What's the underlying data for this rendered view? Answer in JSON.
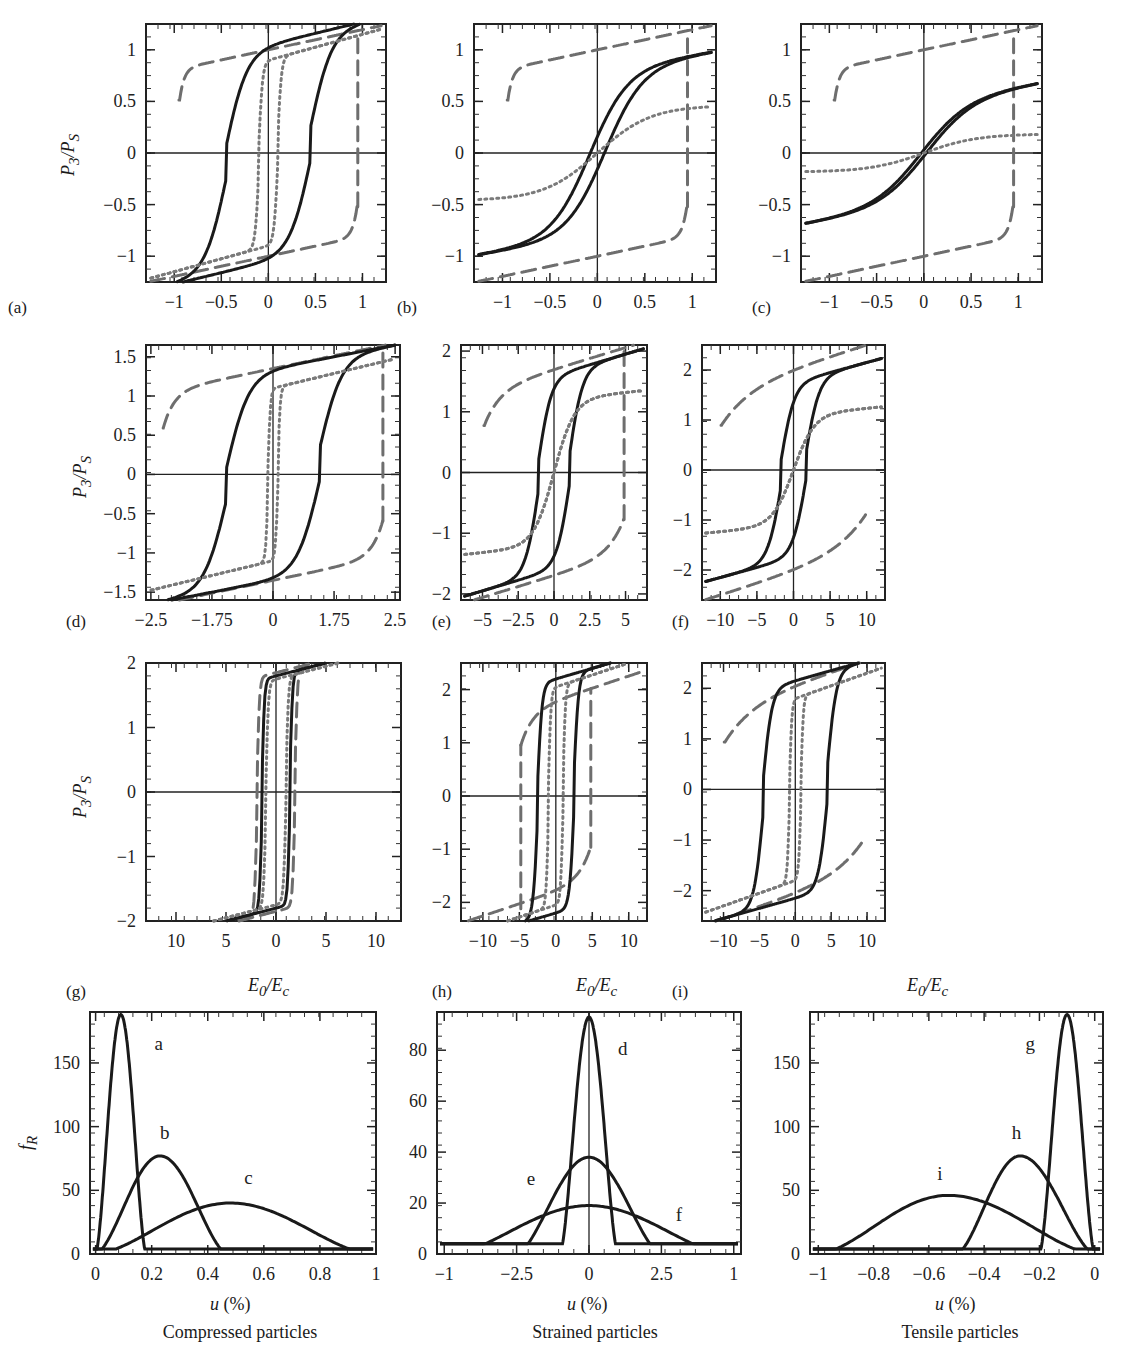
{
  "figure": {
    "y_axis_title_hysteresis": "P3/PS",
    "x_axis_title_hysteresis": "E0/Ec",
    "y_axis_title_distribution": "fR",
    "x_axis_title_distribution": "u (%)",
    "line_styles": {
      "solid": {
        "color": "#1a1a1a",
        "width": 3,
        "dash": ""
      },
      "dashed": {
        "color": "#6e6e6e",
        "width": 3,
        "dash": "14 8"
      },
      "dotted": {
        "color": "#7a7a7a",
        "width": 3,
        "dash": "2 4"
      }
    }
  },
  "chart_data": [
    {
      "id": "a",
      "panel_label": "(a)",
      "type": "line",
      "xlabel": "",
      "ylabel": "P3/PS",
      "xlim": [
        -1.3,
        1.25
      ],
      "ylim": [
        -1.25,
        1.25
      ],
      "xticks": [
        -1,
        -0.5,
        0,
        0.5,
        1
      ],
      "xtick_labels": [
        "−1",
        "−0.5",
        "0",
        "0.5",
        "1"
      ],
      "yticks": [
        -1,
        -0.5,
        0,
        0.5,
        1
      ],
      "ytick_labels": [
        "−1",
        "−0.5",
        "0",
        "0.5",
        "1"
      ],
      "series": [
        {
          "name": "dashed",
          "style": "dashed",
          "Ec": 0.95,
          "Pr": 1.0,
          "Psat": 1.2,
          "slope": 0.15,
          "k": 40
        },
        {
          "name": "solid",
          "style": "solid",
          "Ec": 0.45,
          "Pr": 0.8,
          "Psat": 1.05,
          "slope": 0.22,
          "k": 4.5,
          "close_at": 0.85
        },
        {
          "name": "dotted",
          "style": "dotted",
          "Ec": 0.1,
          "Pr": 0.55,
          "Psat": 0.9,
          "slope": 0.25,
          "k": 25
        }
      ]
    },
    {
      "id": "b",
      "panel_label": "(b)",
      "type": "line",
      "xlabel": "",
      "ylabel": "",
      "xlim": [
        -1.3,
        1.25
      ],
      "ylim": [
        -1.25,
        1.25
      ],
      "xticks": [
        -1,
        -0.5,
        0,
        0.5,
        1
      ],
      "xtick_labels": [
        "−1",
        "−0.5",
        "0",
        "0.5",
        "1"
      ],
      "yticks": [
        -1,
        -0.5,
        0,
        0.5,
        1
      ],
      "ytick_labels": [
        "−1",
        "−0.5",
        "0",
        "0.5",
        "1"
      ],
      "series": [
        {
          "name": "dashed",
          "style": "dashed",
          "Ec": 0.95,
          "Pr": 1.0,
          "Psat": 1.2,
          "slope": 0.15,
          "k": 40
        },
        {
          "name": "solid",
          "style": "solid",
          "Ec": 0.08,
          "Pr": 0.33,
          "Psat": 0.8,
          "slope": 0.3,
          "k": 5,
          "close_at": 0.7,
          "shape": "soft"
        },
        {
          "name": "dotted",
          "style": "dotted",
          "linear": true,
          "x": [
            -1.3,
            1.25
          ],
          "y": [
            -0.45,
            0.45
          ],
          "curve": 0.35
        }
      ]
    },
    {
      "id": "c",
      "panel_label": "(c)",
      "type": "line",
      "xlabel": "",
      "ylabel": "",
      "xlim": [
        -1.3,
        1.25
      ],
      "ylim": [
        -1.25,
        1.25
      ],
      "xticks": [
        -1,
        -0.5,
        0,
        0.5,
        1
      ],
      "xtick_labels": [
        "−1",
        "−0.5",
        "0",
        "0.5",
        "1"
      ],
      "yticks": [
        -1,
        -0.5,
        0,
        0.5,
        1
      ],
      "ytick_labels": [
        "−1",
        "−0.5",
        "0",
        "0.5",
        "1"
      ],
      "series": [
        {
          "name": "dashed",
          "style": "dashed",
          "Ec": 0.95,
          "Pr": 1.0,
          "Psat": 1.2,
          "slope": 0.15,
          "k": 40
        },
        {
          "name": "solid",
          "style": "solid",
          "Ec": 0.03,
          "Pr": 0.05,
          "Psat": 0.5,
          "slope": 0.3,
          "k": 4,
          "close_at": 0.35,
          "shape": "soft"
        },
        {
          "name": "dotted",
          "style": "dotted",
          "linear": true,
          "x": [
            -1.3,
            1.25
          ],
          "y": [
            -0.18,
            0.18
          ],
          "curve": 0.2
        }
      ]
    },
    {
      "id": "d",
      "panel_label": "(d)",
      "type": "line",
      "xlabel": "",
      "ylabel": "P3/PS",
      "xlim": [
        -2.6,
        2.6
      ],
      "ylim": [
        -1.6,
        1.65
      ],
      "xticks": [
        -2.5,
        -1.25,
        0,
        1.25,
        2.5
      ],
      "xtick_labels": [
        "−2.5",
        "−1.75",
        "0",
        "1.75",
        "2.5"
      ],
      "yticks": [
        -1.5,
        -1,
        -0.5,
        0,
        0.5,
        1,
        1.5
      ],
      "ytick_labels": [
        "−1.5",
        "−1",
        "−0.5",
        "0",
        "0.5",
        "1",
        "1.5"
      ],
      "series": [
        {
          "name": "dashed",
          "style": "dashed",
          "Ec": 2.25,
          "Pr": 1.35,
          "Psat": 1.6,
          "slope": 0.1,
          "k": 20
        },
        {
          "name": "solid",
          "style": "solid",
          "Ec": 0.95,
          "Pr": 1.02,
          "Psat": 1.35,
          "slope": 0.12,
          "k": 2.2,
          "close_at": 2.2
        },
        {
          "name": "dotted",
          "style": "dotted",
          "Ec": 0.1,
          "Pr": 0.6,
          "Psat": 1.1,
          "slope": 0.15,
          "k": 20
        }
      ]
    },
    {
      "id": "e",
      "panel_label": "(e)",
      "type": "line",
      "xlabel": "",
      "ylabel": "",
      "xlim": [
        -6.5,
        6.5
      ],
      "ylim": [
        -2.1,
        2.1
      ],
      "xticks": [
        -5,
        -2.5,
        0,
        2.5,
        5
      ],
      "xtick_labels": [
        "−5",
        "−2.5",
        "0",
        "2.5",
        "5"
      ],
      "yticks": [
        -2,
        -1,
        0,
        1,
        2
      ],
      "ytick_labels": [
        "−2",
        "−1",
        "0",
        "1",
        "2"
      ],
      "series": [
        {
          "name": "dashed",
          "style": "dashed",
          "Ec": 4.9,
          "Pr": 1.7,
          "Psat": 2.0,
          "slope": 0.055,
          "k": 9
        },
        {
          "name": "solid",
          "style": "solid",
          "Ec": 1.1,
          "Pr": 1.1,
          "Psat": 1.6,
          "slope": 0.07,
          "k": 1.1,
          "close_at": 4.2
        },
        {
          "name": "dotted",
          "style": "dotted",
          "Ec": 0.0,
          "Pr": 0.0,
          "Psat": 1.2,
          "slope": 0.08,
          "k": 0.7,
          "anhysteretic": true
        }
      ]
    },
    {
      "id": "f",
      "panel_label": "(f)",
      "type": "line",
      "xlabel": "",
      "ylabel": "",
      "xlim": [
        -12.5,
        12.5
      ],
      "ylim": [
        -2.6,
        2.5
      ],
      "xticks": [
        -10,
        -5,
        0,
        5,
        10
      ],
      "xtick_labels": [
        "−10",
        "−5",
        "0",
        "5",
        "10"
      ],
      "yticks": [
        -2,
        -1,
        0,
        1,
        2
      ],
      "ytick_labels": [
        "−2",
        "−1",
        "0",
        "1",
        "2"
      ],
      "series": [
        {
          "name": "dashed",
          "style": "dashed",
          "Ec": 9.9,
          "Pr": 2.05,
          "Psat": 2.45,
          "slope": 0.035,
          "k": 5
        },
        {
          "name": "solid",
          "style": "solid",
          "Ec": 1.7,
          "Pr": 0.9,
          "Psat": 1.75,
          "slope": 0.04,
          "k": 0.55,
          "close_at": 8
        },
        {
          "name": "dotted",
          "style": "dotted",
          "Ec": 0.0,
          "Pr": 0.0,
          "Psat": 1.1,
          "slope": 0.045,
          "k": 0.35,
          "anhysteretic": true
        }
      ]
    },
    {
      "id": "g",
      "panel_label": "(g)",
      "type": "line",
      "xlabel": "E0/Ec",
      "ylabel": "P3/PS",
      "xlim": [
        -13,
        12.5
      ],
      "ylim": [
        -2.0,
        2.0
      ],
      "xticks": [
        -10,
        -5,
        0,
        5,
        10
      ],
      "xtick_labels": [
        "10",
        "5",
        "0",
        "5",
        "10"
      ],
      "yticks": [
        -2,
        -1,
        0,
        1,
        2
      ],
      "ytick_labels": [
        "−2",
        "−1",
        "0",
        "1",
        "2"
      ],
      "series": [
        {
          "name": "dashed",
          "style": "dashed",
          "Ec": 1.9,
          "Pr": 1.3,
          "Psat": 1.85,
          "slope": 0.04,
          "k": 4,
          "close_at": 2.2
        },
        {
          "name": "solid",
          "style": "solid",
          "Ec": 1.4,
          "Pr": 1.25,
          "Psat": 1.8,
          "slope": 0.04,
          "k": 4,
          "close_at": 1.8
        },
        {
          "name": "dotted",
          "style": "dotted",
          "Ec": 1.0,
          "Pr": 1.2,
          "Psat": 1.75,
          "slope": 0.04,
          "k": 4,
          "close_at": 1.6
        }
      ]
    },
    {
      "id": "h",
      "panel_label": "(h)",
      "type": "line",
      "xlabel": "E0/Ec",
      "ylabel": "",
      "xlim": [
        -13,
        12.5
      ],
      "ylim": [
        -2.35,
        2.5
      ],
      "xticks": [
        -10,
        -5,
        0,
        5,
        10
      ],
      "xtick_labels": [
        "−10",
        "−5",
        "0",
        "5",
        "10"
      ],
      "yticks": [
        -2,
        -1,
        0,
        1,
        2
      ],
      "ytick_labels": [
        "−2",
        "−1",
        "0",
        "1",
        "2"
      ],
      "series": [
        {
          "name": "dashed",
          "style": "dashed",
          "Ec": 4.8,
          "Pr": 1.8,
          "Psat": 2.35,
          "slope": 0.035,
          "k": 6
        },
        {
          "name": "solid",
          "style": "solid",
          "Ec": 2.5,
          "Pr": 1.5,
          "Psat": 2.2,
          "slope": 0.04,
          "k": 1.6,
          "close_at": 4.5
        },
        {
          "name": "dotted",
          "style": "dotted",
          "Ec": 1.0,
          "Pr": 1.1,
          "Psat": 2.05,
          "slope": 0.045,
          "k": 3
        }
      ]
    },
    {
      "id": "i",
      "panel_label": "(i)",
      "type": "line",
      "xlabel": "E0/Ec",
      "ylabel": "",
      "xlim": [
        -13,
        12.5
      ],
      "ylim": [
        -2.6,
        2.5
      ],
      "xticks": [
        -10,
        -5,
        0,
        5,
        10
      ],
      "xtick_labels": [
        "−10",
        "−5",
        "0",
        "5",
        "10"
      ],
      "yticks": [
        -2,
        -1,
        0,
        1,
        2
      ],
      "ytick_labels": [
        "−2",
        "−1",
        "0",
        "1",
        "2"
      ],
      "series": [
        {
          "name": "dashed",
          "style": "dashed",
          "Ec": 9.9,
          "Pr": 2.1,
          "Psat": 2.5,
          "slope": 0.035,
          "k": 5
        },
        {
          "name": "solid",
          "style": "solid",
          "Ec": 4.5,
          "Pr": 1.6,
          "Psat": 2.15,
          "slope": 0.04,
          "k": 0.8,
          "close_at": 9
        },
        {
          "name": "dotted",
          "style": "dotted",
          "Ec": 0.8,
          "Pr": 1.05,
          "Psat": 1.8,
          "slope": 0.05,
          "k": 3
        }
      ]
    },
    {
      "id": "dist-compressed",
      "panel_label": "",
      "type": "line",
      "title": "Compressed particles",
      "xlabel": "u (%)",
      "ylabel": "fR",
      "xlim": [
        -0.02,
        1.0
      ],
      "ylim": [
        0,
        190
      ],
      "xticks": [
        0,
        0.2,
        0.4,
        0.6,
        0.8,
        1
      ],
      "xtick_labels": [
        "0",
        "0.2",
        "0.4",
        "0.6",
        "0.8",
        "1"
      ],
      "yticks": [
        0,
        50,
        100,
        150
      ],
      "ytick_labels": [
        "0",
        "50",
        "100",
        "150"
      ],
      "series": [
        {
          "name": "a",
          "peak_x": 0.09,
          "peak_y": 188,
          "x0": 0.0,
          "x1": 0.18,
          "label_pos": [
            0.21,
            160
          ]
        },
        {
          "name": "b",
          "peak_x": 0.23,
          "peak_y": 77,
          "x0": 0.0,
          "x1": 0.47,
          "label_pos": [
            0.23,
            90
          ]
        },
        {
          "name": "c",
          "peak_x": 0.48,
          "peak_y": 40,
          "x0": 0.0,
          "x1": 0.98,
          "label_pos": [
            0.53,
            55
          ]
        }
      ]
    },
    {
      "id": "dist-strained",
      "panel_label": "",
      "type": "line",
      "title": "Strained particles",
      "xlabel": "u (%)",
      "ylabel": "",
      "xlim": [
        -1.05,
        1.05
      ],
      "ylim": [
        0,
        95
      ],
      "xticks": [
        -1,
        -0.5,
        0,
        0.5,
        1
      ],
      "xtick_labels": [
        "−1",
        "−2.5",
        "0",
        "2.5",
        "1"
      ],
      "yticks": [
        0,
        20,
        40,
        60,
        80
      ],
      "ytick_labels": [
        "0",
        "20",
        "40",
        "60",
        "80"
      ],
      "series": [
        {
          "name": "d",
          "peak_x": 0.0,
          "peak_y": 93,
          "x0": -0.2,
          "x1": 0.2,
          "label_pos": [
            0.2,
            78
          ]
        },
        {
          "name": "e",
          "peak_x": 0.0,
          "peak_y": 38,
          "x0": -0.5,
          "x1": 0.5,
          "label_pos": [
            -0.43,
            27
          ]
        },
        {
          "name": "f",
          "peak_x": 0.0,
          "peak_y": 19,
          "x0": -0.95,
          "x1": 0.95,
          "label_pos": [
            0.6,
            13
          ]
        }
      ]
    },
    {
      "id": "dist-tensile",
      "panel_label": "",
      "type": "line",
      "title": "Tensile particles",
      "xlabel": "u (%)",
      "ylabel": "",
      "xlim": [
        -1.03,
        0.03
      ],
      "ylim": [
        0,
        190
      ],
      "xticks": [
        -1,
        -0.8,
        -0.6,
        -0.4,
        -0.2,
        0
      ],
      "xtick_labels": [
        "−1",
        "−0.8",
        "−0.6",
        "−0.4",
        "−0.2",
        "0"
      ],
      "yticks": [
        0,
        50,
        100,
        150
      ],
      "ytick_labels": [
        "0",
        "50",
        "100",
        "150"
      ],
      "series": [
        {
          "name": "g",
          "peak_x": -0.1,
          "peak_y": 188,
          "x0": -0.2,
          "x1": 0.0,
          "label_pos": [
            -0.25,
            160
          ]
        },
        {
          "name": "h",
          "peak_x": -0.27,
          "peak_y": 77,
          "x0": -0.5,
          "x1": 0.0,
          "label_pos": [
            -0.3,
            90
          ]
        },
        {
          "name": "i",
          "peak_x": -0.53,
          "peak_y": 46,
          "x0": -1.0,
          "x1": 0.0,
          "label_pos": [
            -0.57,
            58
          ]
        }
      ]
    }
  ]
}
